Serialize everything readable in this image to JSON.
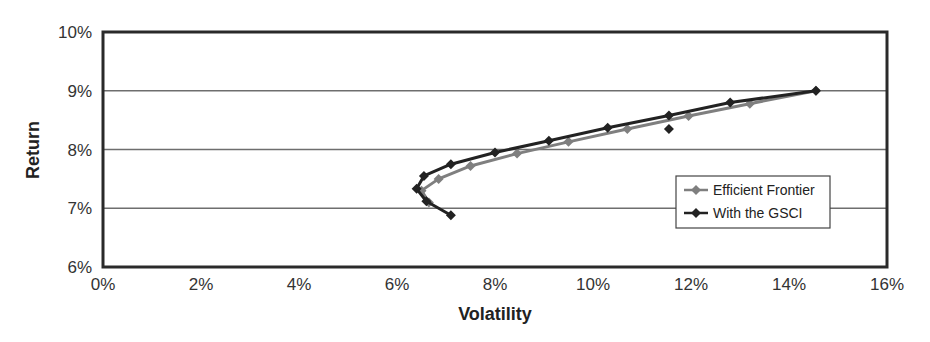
{
  "chart_data": {
    "type": "line",
    "title": "",
    "xlabel": "Volatility",
    "ylabel": "Return",
    "xlim": [
      0,
      16
    ],
    "ylim": [
      6,
      10
    ],
    "x_ticks": [
      "0%",
      "2%",
      "4%",
      "6%",
      "8%",
      "10%",
      "12%",
      "14%",
      "16%"
    ],
    "y_ticks": [
      "6%",
      "7%",
      "8%",
      "9%",
      "10%"
    ],
    "grid": {
      "horizontal": true,
      "vertical": false
    },
    "legend": {
      "position": "inside-right",
      "entries": [
        "Efficient Frontier",
        "With the GSCI"
      ]
    },
    "series": [
      {
        "name": "Efficient Frontier",
        "color": "#7f7f7f",
        "marker": "diamond",
        "x": [
          6.65,
          6.5,
          6.85,
          7.5,
          8.45,
          9.5,
          10.7,
          11.95,
          13.2,
          14.55
        ],
        "y": [
          7.1,
          7.3,
          7.5,
          7.72,
          7.93,
          8.13,
          8.35,
          8.57,
          8.78,
          9.0
        ]
      },
      {
        "name": "With the GSCI",
        "color": "#222222",
        "marker": "diamond",
        "x": [
          7.1,
          6.6,
          6.4,
          6.55,
          7.1,
          8.0,
          9.1,
          10.3,
          11.55,
          12.8,
          14.55
        ],
        "y": [
          6.88,
          7.12,
          7.33,
          7.55,
          7.75,
          7.95,
          8.15,
          8.37,
          8.58,
          8.8,
          9.0
        ]
      },
      {
        "name": "With the GSCI (isolated point)",
        "color": "#222222",
        "marker": "diamond",
        "line": false,
        "x": [
          11.55
        ],
        "y": [
          8.35
        ]
      }
    ]
  },
  "axes": {
    "x_title": "Volatility",
    "y_title": "Return"
  },
  "legend": {
    "items": [
      {
        "label": "Efficient Frontier",
        "color": "#7f7f7f"
      },
      {
        "label": "With the GSCI",
        "color": "#222222"
      }
    ]
  }
}
